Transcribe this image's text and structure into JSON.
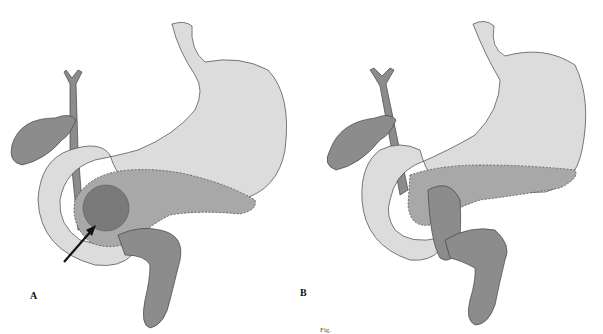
{
  "figure": {
    "panels": [
      {
        "label": "A",
        "description": "Stomach, duodenum, gallbladder and bile duct with pancreatic lesion and arrow"
      },
      {
        "label": "B",
        "description": "Post-operative reconstruction with sutured pancreas"
      }
    ],
    "caption": "Fig."
  },
  "colors": {
    "organ_light": "#dcdcdc",
    "organ_dark": "#8c8c8c",
    "organ_mid": "#a8a8a8",
    "lesion": "#7a7a7a",
    "outline": "#444444",
    "background": "#ffffff"
  }
}
